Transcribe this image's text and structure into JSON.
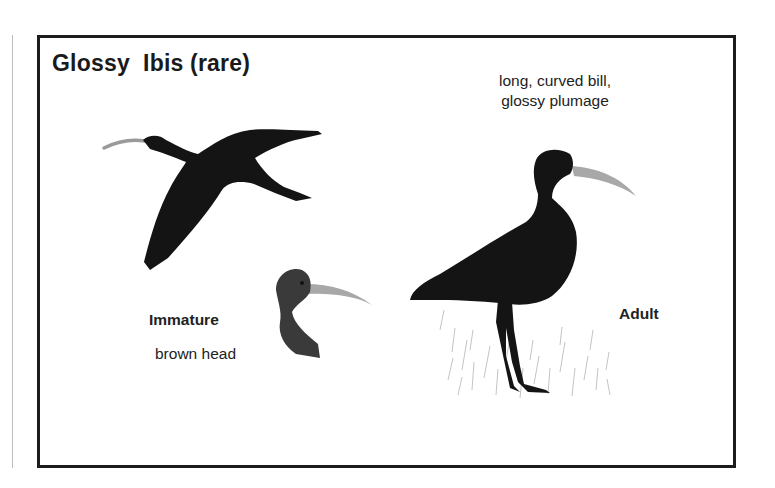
{
  "plate": {
    "title": "Glossy  Ibis (rare)",
    "caption_line1": "long, curved bill,",
    "caption_line2": "glossy plumage",
    "immature_label": "Immature",
    "immature_note": "brown head",
    "adult_label": "Adult"
  },
  "illustrations": [
    {
      "name": "flying-ibis",
      "description": "Glossy ibis in flight, dark silhouette"
    },
    {
      "name": "immature-ibis-head",
      "description": "Immature head and neck, brown head, pale curved bill"
    },
    {
      "name": "adult-ibis-standing",
      "description": "Adult glossy ibis standing in grass, long curved bill"
    }
  ],
  "colors": {
    "frame": "#1c1c1c",
    "bird_body": "#141414",
    "bill": "#a8a8a8",
    "grass": "#c8c8c8"
  }
}
